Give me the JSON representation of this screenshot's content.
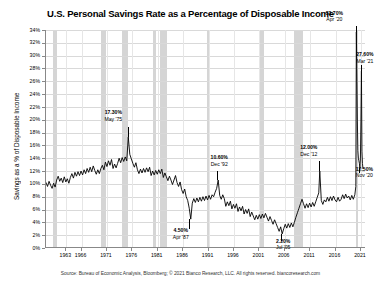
{
  "chart_data": {
    "type": "line",
    "title": "U.S. Personal Savings Rate as a Percentage of Disposable Income",
    "xlabel": "",
    "ylabel": "Savings as a % of Disposable Income",
    "ylim": [
      0,
      34
    ],
    "xlim": [
      1959,
      2022
    ],
    "ytick_labels": [
      "34%",
      "32%",
      "30%",
      "28%",
      "26%",
      "24%",
      "22%",
      "20%",
      "18%",
      "16%",
      "14%",
      "12%",
      "10%",
      "8%",
      "6%",
      "4%",
      "2%",
      "0%"
    ],
    "ytick_values": [
      34,
      32,
      30,
      28,
      26,
      24,
      22,
      20,
      18,
      16,
      14,
      12,
      10,
      8,
      6,
      4,
      2,
      0
    ],
    "xtick_labels": [
      "1963",
      "1966",
      "1971",
      "1976",
      "1981",
      "1986",
      "1991",
      "1996",
      "2001",
      "2006",
      "2011",
      "2016",
      "2021"
    ],
    "xtick_values": [
      1963,
      1966,
      1971,
      1976,
      1981,
      1986,
      1991,
      1996,
      2001,
      2006,
      2011,
      2016,
      2021
    ],
    "grid": true,
    "legend": "none",
    "series_color": "#000000",
    "recession_band_color": "#d5d5d5",
    "recession_bands": [
      {
        "start": 1960.3,
        "end": 1961.2
      },
      {
        "start": 1969.9,
        "end": 1970.9
      },
      {
        "start": 1973.9,
        "end": 1975.2
      },
      {
        "start": 1980.0,
        "end": 1980.6
      },
      {
        "start": 1981.5,
        "end": 1982.9
      },
      {
        "start": 1990.6,
        "end": 1991.2
      },
      {
        "start": 2001.2,
        "end": 2001.9
      },
      {
        "start": 2007.9,
        "end": 2009.5
      },
      {
        "start": 2020.1,
        "end": 2020.4
      }
    ],
    "annotations": [
      {
        "value": "17.30%",
        "date": "May '75",
        "x": 1975.4,
        "y": 17.3
      },
      {
        "value": "10.60%",
        "date": "Dec '92",
        "x": 1992.9,
        "y": 10.6
      },
      {
        "value": "4.50%",
        "date": "Apr '87",
        "x": 1987.3,
        "y": 4.5
      },
      {
        "value": "2.20%",
        "date": "Jul '05",
        "x": 2005.5,
        "y": 2.2
      },
      {
        "value": "12.00%",
        "date": "Dec '12",
        "x": 2012.9,
        "y": 12.0
      },
      {
        "value": "33.70%",
        "date": "Apr '20",
        "x": 2020.3,
        "y": 33.7
      },
      {
        "value": "27.60%",
        "date": "Mar '21",
        "x": 2021.2,
        "y": 27.6
      },
      {
        "value": "12.50%",
        "date": "Nov '20",
        "x": 2020.9,
        "y": 12.5
      }
    ],
    "x": [
      1959.0,
      1959.3,
      1959.6,
      1959.9,
      1960.2,
      1960.5,
      1960.8,
      1961.1,
      1961.4,
      1961.7,
      1962.0,
      1962.3,
      1962.6,
      1962.9,
      1963.2,
      1963.5,
      1963.8,
      1964.1,
      1964.4,
      1964.7,
      1965.0,
      1965.3,
      1965.6,
      1965.9,
      1966.2,
      1966.5,
      1966.8,
      1967.1,
      1967.4,
      1967.7,
      1968.0,
      1968.3,
      1968.6,
      1968.9,
      1969.2,
      1969.5,
      1969.8,
      1970.1,
      1970.4,
      1970.7,
      1971.0,
      1971.3,
      1971.6,
      1971.9,
      1972.2,
      1972.5,
      1972.8,
      1973.1,
      1973.4,
      1973.7,
      1974.0,
      1974.3,
      1974.6,
      1974.9,
      1975.2,
      1975.5,
      1975.8,
      1976.1,
      1976.4,
      1976.7,
      1977.0,
      1977.3,
      1977.6,
      1977.9,
      1978.2,
      1978.5,
      1978.8,
      1979.1,
      1979.4,
      1979.7,
      1980.0,
      1980.3,
      1980.6,
      1980.9,
      1981.2,
      1981.5,
      1981.8,
      1982.1,
      1982.4,
      1982.7,
      1983.0,
      1983.3,
      1983.6,
      1983.9,
      1984.2,
      1984.5,
      1984.8,
      1985.1,
      1985.4,
      1985.7,
      1986.0,
      1986.3,
      1986.6,
      1986.9,
      1987.2,
      1987.5,
      1987.8,
      1988.1,
      1988.4,
      1988.7,
      1989.0,
      1989.3,
      1989.6,
      1989.9,
      1990.2,
      1990.5,
      1990.8,
      1991.1,
      1991.4,
      1991.7,
      1992.0,
      1992.3,
      1992.6,
      1992.9,
      1993.2,
      1993.5,
      1993.8,
      1994.1,
      1994.4,
      1994.7,
      1995.0,
      1995.3,
      1995.6,
      1995.9,
      1996.2,
      1996.5,
      1996.8,
      1997.1,
      1997.4,
      1997.7,
      1998.0,
      1998.3,
      1998.6,
      1998.9,
      1999.2,
      1999.5,
      1999.8,
      2000.1,
      2000.4,
      2000.7,
      2001.0,
      2001.3,
      2001.6,
      2001.9,
      2002.2,
      2002.5,
      2002.8,
      2003.1,
      2003.4,
      2003.7,
      2004.0,
      2004.3,
      2004.6,
      2004.9,
      2005.2,
      2005.5,
      2005.8,
      2006.1,
      2006.4,
      2006.7,
      2007.0,
      2007.3,
      2007.6,
      2007.9,
      2008.2,
      2008.5,
      2008.8,
      2009.1,
      2009.4,
      2009.7,
      2010.0,
      2010.3,
      2010.6,
      2010.9,
      2011.2,
      2011.5,
      2011.8,
      2012.1,
      2012.4,
      2012.7,
      2012.9,
      2013.2,
      2013.5,
      2013.8,
      2014.1,
      2014.4,
      2014.7,
      2015.0,
      2015.3,
      2015.6,
      2015.9,
      2016.2,
      2016.5,
      2016.8,
      2017.1,
      2017.4,
      2017.7,
      2018.0,
      2018.3,
      2018.6,
      2018.9,
      2019.2,
      2019.5,
      2019.8,
      2020.0,
      2020.1,
      2020.3,
      2020.4,
      2020.5,
      2020.6,
      2020.7,
      2020.8,
      2020.9,
      2021.0,
      2021.1,
      2021.2,
      2021.3,
      2021.4,
      2021.5
    ],
    "y": [
      10.2,
      9.6,
      10.4,
      9.8,
      9.3,
      10.1,
      9.5,
      10.6,
      11.2,
      10.4,
      10.9,
      10.2,
      11.1,
      10.3,
      10.8,
      10.1,
      11.0,
      11.6,
      10.9,
      11.8,
      11.2,
      11.9,
      11.3,
      12.0,
      11.4,
      12.2,
      11.6,
      12.4,
      11.8,
      12.6,
      11.9,
      12.8,
      12.1,
      11.5,
      12.2,
      11.6,
      12.4,
      12.9,
      12.2,
      13.4,
      12.7,
      13.6,
      12.9,
      13.8,
      12.4,
      13.1,
      12.5,
      13.2,
      14.0,
      13.3,
      14.1,
      13.5,
      14.2,
      13.6,
      17.3,
      14.6,
      13.9,
      13.2,
      12.6,
      13.3,
      12.2,
      11.6,
      12.3,
      11.7,
      12.4,
      11.8,
      12.5,
      11.9,
      12.6,
      11.3,
      12.0,
      11.4,
      12.1,
      11.5,
      12.2,
      11.6,
      12.3,
      11.0,
      11.7,
      11.1,
      10.5,
      11.2,
      10.6,
      9.9,
      10.6,
      11.3,
      10.2,
      9.6,
      10.3,
      9.1,
      8.5,
      9.2,
      8.0,
      7.4,
      6.2,
      4.5,
      7.0,
      7.7,
      7.1,
      7.8,
      7.2,
      7.9,
      7.3,
      8.0,
      7.4,
      8.1,
      7.5,
      8.2,
      7.6,
      8.3,
      8.0,
      8.7,
      9.3,
      10.6,
      8.2,
      7.6,
      8.3,
      7.7,
      6.5,
      7.2,
      6.6,
      7.3,
      6.1,
      6.8,
      6.2,
      6.9,
      5.7,
      6.4,
      5.8,
      6.5,
      5.3,
      6.0,
      5.4,
      6.1,
      4.9,
      5.6,
      5.0,
      4.4,
      5.1,
      4.5,
      5.2,
      4.6,
      5.3,
      4.7,
      5.4,
      4.8,
      4.2,
      4.9,
      4.3,
      3.7,
      4.4,
      3.8,
      3.2,
      2.6,
      3.3,
      2.2,
      3.0,
      3.7,
      3.1,
      3.8,
      3.2,
      3.9,
      3.3,
      4.0,
      4.8,
      5.5,
      6.2,
      6.9,
      7.6,
      6.9,
      6.2,
      6.9,
      6.3,
      7.0,
      6.4,
      7.1,
      6.5,
      7.2,
      7.9,
      8.6,
      12.0,
      7.4,
      6.8,
      7.5,
      7.2,
      7.9,
      7.3,
      8.0,
      7.4,
      8.1,
      7.5,
      7.2,
      7.9,
      7.3,
      7.6,
      8.3,
      7.7,
      8.4,
      7.8,
      8.1,
      7.5,
      8.2,
      7.6,
      8.3,
      9.6,
      33.7,
      19.8,
      15.2,
      14.0,
      13.6,
      13.2,
      12.5,
      13.9,
      19.8,
      27.6,
      15.1,
      13.2,
      12.4
    ]
  },
  "source": {
    "text": "Source: Bureau of Economic Analysis, Bloomberg; © 2021 Bianco Research, LLC. All rights reserved. biancoresearch.com"
  }
}
